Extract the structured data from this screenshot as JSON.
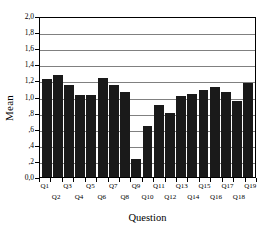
{
  "chart_data": {
    "type": "bar",
    "title": "",
    "xlabel": "Question",
    "ylabel": "Mean",
    "ylim": [
      0,
      2.0
    ],
    "ytick_step": 0.2,
    "grid": true,
    "legend": false,
    "legend_position": "none",
    "bar_color": "#1a1a1a",
    "gridline_color": "#808080",
    "axis_color": "#000000",
    "background_color": "#ffffff",
    "decimal_separator": ",",
    "categories": [
      "Q1",
      "Q2",
      "Q3",
      "Q4",
      "Q5",
      "Q6",
      "Q7",
      "Q8",
      "Q9",
      "Q10",
      "Q11",
      "Q12",
      "Q13",
      "Q14",
      "Q15",
      "Q16",
      "Q17",
      "Q18",
      "Q19"
    ],
    "values": [
      1.22,
      1.27,
      1.14,
      1.02,
      1.02,
      1.23,
      1.14,
      1.05,
      0.23,
      0.63,
      0.89,
      0.8,
      1.01,
      1.03,
      1.08,
      1.12,
      1.06,
      0.95,
      1.17
    ],
    "ytick_labels": [
      "2,0",
      "1,8",
      "1,6",
      "1,4",
      "1,2",
      "1,0",
      ",8",
      ",6",
      ",4",
      ",2",
      "0,0"
    ],
    "ytick_values": [
      2.0,
      1.8,
      1.6,
      1.4,
      1.2,
      1.0,
      0.8,
      0.6,
      0.4,
      0.2,
      0.0
    ],
    "gridline_values": [
      1.8,
      1.6,
      1.4,
      1.2,
      1.0,
      0.8,
      0.6,
      0.4,
      0.2
    ]
  }
}
